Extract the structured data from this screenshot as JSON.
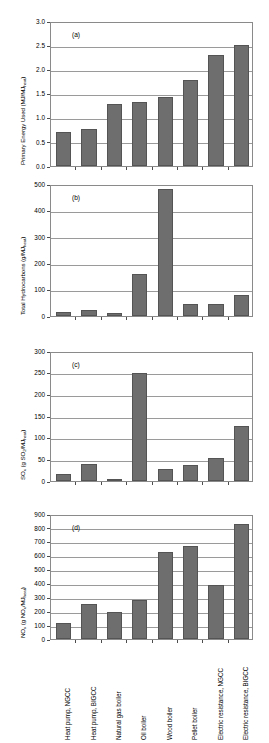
{
  "figure": {
    "bar_color": "#6e6e6e",
    "bar_edge_color": "#545454",
    "axis_color": "#8a8a8a",
    "background": "#ffffff"
  },
  "categories": [
    "Heat pump, NGCC",
    "Heat pump, BIGCC",
    "Natural gas boiler",
    "Oil boiler",
    "Wood boiler",
    "Pellet boiler",
    "Electric resistance, NGCC",
    "Electric resistance, BIGCC"
  ],
  "panels": {
    "a": {
      "tag": "(a)",
      "ylabel_main": "Primary Energy Used (MJ/MJ",
      "ylabel_sub": "heat",
      "ylabel_close": ")",
      "ticks": [
        "0.0",
        "0.5",
        "1.0",
        "1.5",
        "2.0",
        "2.5",
        "3.0"
      ]
    },
    "b": {
      "tag": "(b)",
      "ylabel_main": "Total Hydrocarbons (g/MJ",
      "ylabel_sub": "heat",
      "ylabel_close": ")",
      "ticks": [
        "0",
        "100",
        "200",
        "300",
        "400",
        "500"
      ]
    },
    "c": {
      "tag": "(c)",
      "ylabel_pre": "SO",
      "ylabel_pre_sub": "x",
      "ylabel_mid": " (g SO",
      "ylabel_mid_sub": "2",
      "ylabel_mid2": "/MJ",
      "ylabel_sub": "heat",
      "ylabel_close": ")",
      "ticks": [
        "0",
        "50",
        "100",
        "150",
        "200",
        "250",
        "300"
      ]
    },
    "d": {
      "tag": "(d)",
      "ylabel_pre": "NO",
      "ylabel_pre_sub": "x",
      "ylabel_mid": " (g NO",
      "ylabel_mid_sub": "x",
      "ylabel_mid2": "/MJ",
      "ylabel_sub": "heat",
      "ylabel_close": ")",
      "ticks": [
        "0",
        "100",
        "200",
        "300",
        "400",
        "500",
        "600",
        "700",
        "800",
        "900"
      ]
    }
  },
  "chart_data": [
    {
      "type": "bar",
      "panel": "a",
      "title": "(a)",
      "ylabel": "Primary Energy Used (MJ/MJheat)",
      "xlabel": "",
      "ylim": [
        0,
        3.0
      ],
      "ytick_values": [
        0.0,
        0.5,
        1.0,
        1.5,
        2.0,
        2.5,
        3.0
      ],
      "grid": true,
      "legend": "none",
      "categories": [
        "Heat pump, NGCC",
        "Heat pump, BIGCC",
        "Natural gas boiler",
        "Oil boiler",
        "Wood boiler",
        "Pellet boiler",
        "Electric resistance, NGCC",
        "Electric resistance, BIGCC"
      ],
      "values": [
        0.71,
        0.77,
        1.29,
        1.32,
        1.42,
        1.78,
        2.3,
        2.5
      ]
    },
    {
      "type": "bar",
      "panel": "b",
      "title": "(b)",
      "ylabel": "Total Hydrocarbons (g/MJheat)",
      "xlabel": "",
      "ylim": [
        0,
        500
      ],
      "ytick_values": [
        0,
        100,
        200,
        300,
        400,
        500
      ],
      "grid": true,
      "legend": "none",
      "categories": [
        "Heat pump, NGCC",
        "Heat pump, BIGCC",
        "Natural gas boiler",
        "Oil boiler",
        "Wood boiler",
        "Pellet boiler",
        "Electric resistance, NGCC",
        "Electric resistance, BIGCC"
      ],
      "values": [
        15,
        23,
        12,
        159,
        481,
        44,
        44,
        79
      ]
    },
    {
      "type": "bar",
      "panel": "c",
      "title": "(c)",
      "ylabel": "SOx (g SO2/MJheat)",
      "xlabel": "",
      "ylim": [
        0,
        300
      ],
      "ytick_values": [
        0,
        50,
        100,
        150,
        200,
        250,
        300
      ],
      "grid": true,
      "legend": "none",
      "categories": [
        "Heat pump, NGCC",
        "Heat pump, BIGCC",
        "Natural gas boiler",
        "Oil boiler",
        "Wood boiler",
        "Pellet boiler",
        "Electric resistance, NGCC",
        "Electric resistance, BIGCC"
      ],
      "values": [
        16,
        40,
        2,
        249,
        28,
        38,
        54,
        128
      ]
    },
    {
      "type": "bar",
      "panel": "d",
      "title": "(d)",
      "ylabel": "NOx (g NOx/MJheat)",
      "xlabel": "",
      "ylim": [
        0,
        900
      ],
      "ytick_values": [
        0,
        100,
        200,
        300,
        400,
        500,
        600,
        700,
        800,
        900
      ],
      "grid": true,
      "legend": "none",
      "categories": [
        "Heat pump, NGCC",
        "Heat pump, BIGCC",
        "Natural gas boiler",
        "Oil boiler",
        "Wood boiler",
        "Pellet boiler",
        "Electric resistance, NGCC",
        "Electric resistance, BIGCC"
      ],
      "values": [
        118,
        249,
        197,
        279,
        629,
        670,
        388,
        827
      ]
    }
  ]
}
